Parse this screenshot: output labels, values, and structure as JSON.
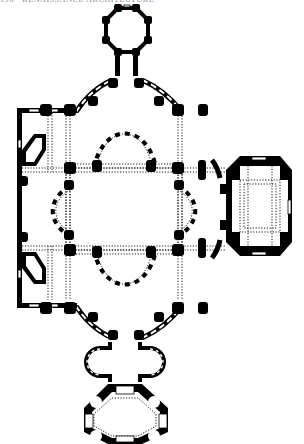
{
  "page": {
    "running_head": "196 · RENAISSANCE ARCHITECTURE",
    "background": "#ffffff",
    "ink": "#000000"
  },
  "plan": {
    "title": "Ground plan of centrally planned church",
    "core_square": {
      "x": 70,
      "y": 168,
      "w": 108,
      "h": 82
    },
    "piers": [
      [
        70,
        168
      ],
      [
        178,
        168
      ],
      [
        70,
        250
      ],
      [
        178,
        250
      ],
      [
        70,
        128
      ],
      [
        178,
        128
      ],
      [
        70,
        290
      ],
      [
        178,
        290
      ],
      [
        22,
        128
      ],
      [
        22,
        290
      ],
      [
        226,
        168
      ],
      [
        226,
        250
      ]
    ],
    "apses": [
      {
        "name": "north-apse",
        "cx": 124,
        "cy": 168,
        "r": 54,
        "start": 180,
        "end": 360
      },
      {
        "name": "south-apse",
        "cx": 124,
        "cy": 250,
        "r": 54,
        "start": 0,
        "end": 180
      },
      {
        "name": "west-apse",
        "cx": 70,
        "cy": 209,
        "r": 48,
        "start": 90,
        "end": 270
      },
      {
        "name": "east-apse",
        "cx": 178,
        "cy": 209,
        "r": 48,
        "start": 270,
        "end": 450
      }
    ],
    "chapels": [
      {
        "name": "north-chapel",
        "cx": 127,
        "cy": 33,
        "r": 24,
        "sides": 8
      },
      {
        "name": "south-chapel",
        "cx": 124,
        "cy": 393,
        "r": 44,
        "sides": 8
      },
      {
        "name": "east-annex",
        "cx": 258,
        "cy": 206,
        "r": 32,
        "sides": 8
      }
    ]
  }
}
